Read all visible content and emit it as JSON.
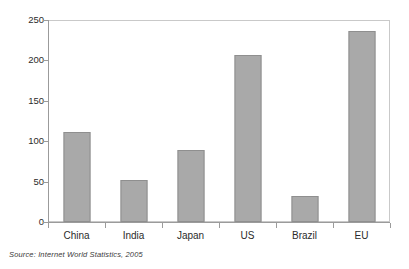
{
  "chart_data": {
    "type": "bar",
    "title": "",
    "subtitle": "",
    "xlabel": "",
    "ylabel": "",
    "categories": [
      "China",
      "India",
      "Japan",
      "US",
      "Brazil",
      "EU"
    ],
    "values": [
      112,
      52,
      89,
      207,
      32,
      237
    ],
    "ylim": [
      0,
      250
    ],
    "yticks": [
      0,
      50,
      100,
      150,
      200,
      250
    ],
    "ytick_labels": [
      "0",
      "50",
      "100",
      "150",
      "200",
      "250"
    ],
    "grid": false,
    "legend": null,
    "legend_position": "none",
    "bar_color": "#a9a9a9",
    "bar_edge_color": "#8f8f8f",
    "frame_color": "#c9c9c9",
    "axis_color": "#9b9b9b",
    "background": "#ffffff",
    "annotations": []
  },
  "figure": {
    "source_note": "Source:  Internet World Statistics, 2005"
  }
}
